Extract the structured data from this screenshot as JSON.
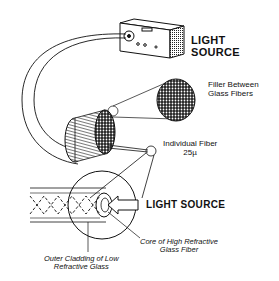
{
  "diagram": {
    "labels": {
      "light_source_top_line1": "LIGHT",
      "light_source_top_line2": "SOURCE",
      "filler_line1": "Filler Between",
      "filler_line2": "Glass Fibers",
      "individual_fiber_line1": "Individual Fiber",
      "individual_fiber_line2": "25µ",
      "light_source_bottom": "LIGHT SOURCE",
      "core_line1": "Core of High Refractive",
      "core_line2": "Glass Fiber",
      "cladding_line1": "Outer Cladding of Low",
      "cladding_line2": "Refractive Glass"
    },
    "colors": {
      "ink": "#111111",
      "background": "#ffffff"
    }
  }
}
